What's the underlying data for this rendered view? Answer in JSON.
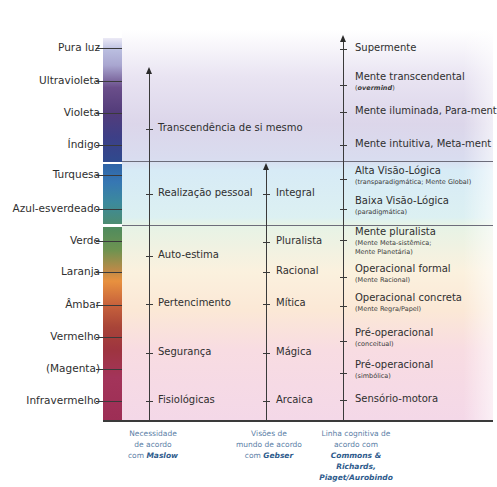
{
  "diagram": {
    "colors": {
      "bar_top": "#533c7a",
      "bar_mid": "#3677b3",
      "bar_bottom": "#9d2e55",
      "caption": "#5a7ea6",
      "caption_emphasis": "#2e5b8c",
      "text": "#2f2f2f"
    },
    "altitudes": [
      {
        "label": "Pura luz",
        "y": 48
      },
      {
        "label": "Ultravioleta",
        "y": 81
      },
      {
        "label": "Violeta",
        "y": 113
      },
      {
        "label": "Índigo",
        "y": 145
      },
      {
        "label": "Turquesa",
        "y": 175
      },
      {
        "label": "Azul-esverdeado",
        "y": 209
      },
      {
        "label": "Verde",
        "y": 241
      },
      {
        "label": "Laranja",
        "y": 272
      },
      {
        "label": "Âmbar",
        "y": 305
      },
      {
        "label": "Vermelho",
        "y": 337
      },
      {
        "label": "(Magenta)",
        "y": 369
      },
      {
        "label": "Infravermelho",
        "y": 401
      }
    ],
    "maslow": {
      "items": [
        {
          "label": "Transcendência de si mesmo",
          "y": 129
        },
        {
          "label": "Realização pessoal",
          "y": 194
        },
        {
          "label": "Auto-estima",
          "y": 256
        },
        {
          "label": "Pertencimento",
          "y": 304
        },
        {
          "label": "Segurança",
          "y": 353
        },
        {
          "label": "Fisiológicas",
          "y": 401
        }
      ],
      "caption_lines": [
        "Necessidade",
        "de acordo",
        "com "
      ],
      "caption_name": "Maslow"
    },
    "gebser": {
      "items": [
        {
          "label": "Integral",
          "y": 194
        },
        {
          "label": "Pluralista",
          "y": 242
        },
        {
          "label": "Racional",
          "y": 272
        },
        {
          "label": "Mítica",
          "y": 304
        },
        {
          "label": "Mágica",
          "y": 353
        },
        {
          "label": "Arcaica",
          "y": 401
        }
      ],
      "caption_lines": [
        "Visões de",
        "mundo de acordo",
        "com "
      ],
      "caption_name": "Gebser"
    },
    "cognitive": {
      "items": [
        {
          "label": "Supermente",
          "sub": "",
          "y": 49
        },
        {
          "label": "Mente transcendental",
          "sub": "overmind",
          "sub_italic": true,
          "y": 78
        },
        {
          "label": "Mente iluminada, Para-ment",
          "sub": "",
          "y": 112
        },
        {
          "label": "Mente intuitiva, Meta-ment",
          "sub": "",
          "y": 145
        },
        {
          "label": "Alta Visão-Lógica",
          "sub": "(transparadigmática; Mente Global)",
          "y": 172
        },
        {
          "label": "Baixa Visão-Lógica",
          "sub": "(paradigmática)",
          "y": 202
        },
        {
          "label": "Mente pluralista",
          "sub": "(Mente Meta-sistêmica;",
          "sub2": "Mente Planetária)",
          "y": 233
        },
        {
          "label": "Operacional formal",
          "sub": "(Mente Racional)",
          "y": 270
        },
        {
          "label": "Operacional concreta",
          "sub": "(Mente Regra/Papel)",
          "y": 299
        },
        {
          "label": "Pré-operacional",
          "sub": "(conceitual)",
          "y": 334
        },
        {
          "label": "Pré-operacional",
          "sub": "(simbólica)",
          "y": 366
        },
        {
          "label": "Sensório-motora",
          "sub": "",
          "y": 400
        }
      ],
      "caption_lines": [
        "Linha cognitiva de",
        "acordo com"
      ],
      "caption_names": [
        "Commons & Richards,",
        "Piaget/Aurobindo"
      ]
    }
  }
}
